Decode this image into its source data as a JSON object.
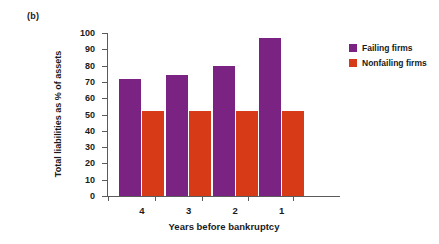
{
  "panel": {
    "label": "(b)"
  },
  "chart_data": {
    "type": "bar",
    "title": "",
    "xlabel": "Years before bankruptcy",
    "ylabel": "Total liabilities as % of assets",
    "categories": [
      "4",
      "3",
      "2",
      "1"
    ],
    "series": [
      {
        "name": "Failing firms",
        "color": "#7B2382",
        "values": [
          72,
          74,
          80,
          97
        ]
      },
      {
        "name": "Nonfailing firms",
        "color": "#D63A16",
        "values": [
          52,
          52,
          52,
          52
        ]
      }
    ],
    "ylim": [
      0,
      100
    ],
    "ytick_step": 10,
    "yticks": [
      "0",
      "10",
      "20",
      "30",
      "40",
      "50",
      "60",
      "70",
      "80",
      "90",
      "100"
    ],
    "grid": false,
    "legend_position": "right-top"
  }
}
